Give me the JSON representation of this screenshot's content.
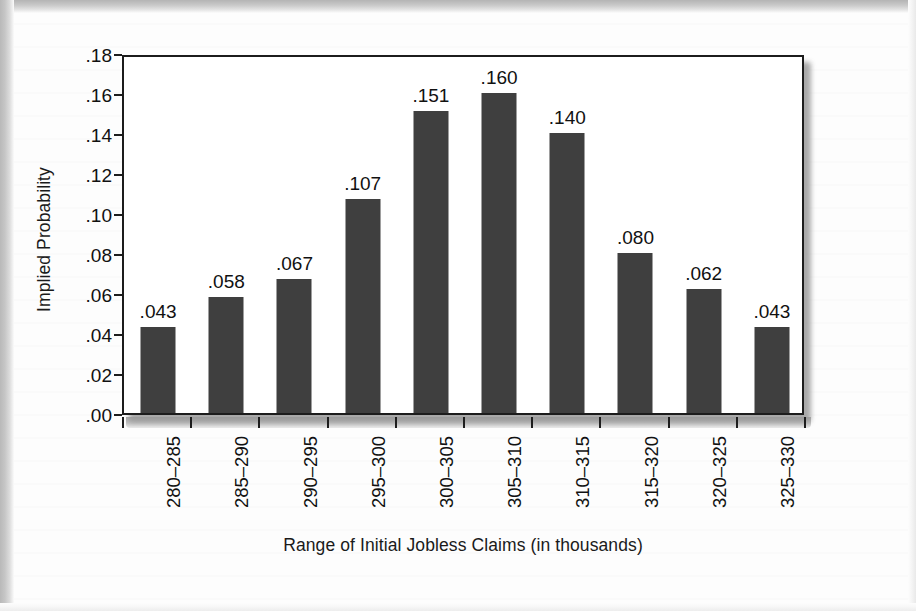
{
  "chart_data": {
    "type": "bar",
    "title": "",
    "xlabel": "Range of Initial Jobless Claims (in thousands)",
    "ylabel": "Implied Probability",
    "categories": [
      "280–285",
      "285–290",
      "290–295",
      "295–300",
      "300–305",
      "305–310",
      "310–315",
      "315–320",
      "320–325",
      "325–330"
    ],
    "values": [
      0.043,
      0.058,
      0.067,
      0.107,
      0.151,
      0.16,
      0.14,
      0.08,
      0.062,
      0.043
    ],
    "value_labels": [
      ".043",
      ".058",
      ".067",
      ".107",
      ".151",
      ".160",
      ".140",
      ".080",
      ".062",
      ".043"
    ],
    "ylim": [
      0.0,
      0.18
    ],
    "ytick_values": [
      0.0,
      0.02,
      0.04,
      0.06,
      0.08,
      0.1,
      0.12,
      0.14,
      0.16,
      0.18
    ],
    "ytick_labels": [
      ".00",
      ".02",
      ".04",
      ".06",
      ".08",
      ".10",
      ".12",
      ".14",
      ".16",
      ".18"
    ],
    "grid": false,
    "legend": null,
    "bar_color": "#3f3f3f",
    "axis_color": "#1c1c1c",
    "plot_background": "#ffffff"
  }
}
